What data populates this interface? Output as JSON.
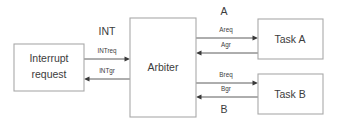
{
  "diagram": {
    "type": "block-diagram",
    "background_color": "#ffffff",
    "line_color": "#4a4a4a",
    "border_color": "#a9a9a9",
    "text_color": "#3c3c3c",
    "blocks": [
      {
        "id": "interrupt-request",
        "label_line1": "Interrupt",
        "label_line2": "request",
        "x": 14,
        "y": 44,
        "width": 70,
        "height": 47
      },
      {
        "id": "arbiter",
        "label": "Arbiter",
        "x": 130,
        "y": 18,
        "width": 66,
        "height": 99
      },
      {
        "id": "task-a",
        "label": "Task A",
        "x": 258,
        "y": 19,
        "width": 65,
        "height": 40
      },
      {
        "id": "task-b",
        "label": "Task B",
        "x": 258,
        "y": 74,
        "width": 65,
        "height": 40
      }
    ],
    "groups": [
      {
        "id": "int-group",
        "label": "INT",
        "x": 107,
        "y": 32
      },
      {
        "id": "a-group",
        "label": "A",
        "x": 224,
        "y": 12
      },
      {
        "id": "b-group",
        "label": "B",
        "x": 224,
        "y": 110
      }
    ],
    "signals": [
      {
        "id": "intreq",
        "label": "INTreq",
        "from": "interrupt-request",
        "to": "arbiter",
        "direction": "right",
        "label_x": 107,
        "label_y": 51,
        "y": 59,
        "x_start": 84,
        "x_end": 130
      },
      {
        "id": "intgr",
        "label": "INTgr",
        "from": "arbiter",
        "to": "interrupt-request",
        "direction": "left",
        "label_x": 107,
        "label_y": 71,
        "y": 79,
        "x_start": 130,
        "x_end": 84
      },
      {
        "id": "areq",
        "label": "Areq",
        "from": "arbiter",
        "to": "task-a",
        "direction": "right",
        "label_x": 226,
        "label_y": 30,
        "y": 38,
        "x_start": 196,
        "x_end": 258
      },
      {
        "id": "agr",
        "label": "Agr",
        "from": "task-a",
        "to": "arbiter",
        "direction": "left",
        "label_x": 226,
        "label_y": 45,
        "y": 53,
        "x_start": 258,
        "x_end": 196
      },
      {
        "id": "breq",
        "label": "Breq",
        "from": "arbiter",
        "to": "task-b",
        "direction": "right",
        "label_x": 226,
        "label_y": 75,
        "y": 83,
        "x_start": 196,
        "x_end": 258
      },
      {
        "id": "bgr",
        "label": "Bgr",
        "from": "task-b",
        "to": "arbiter",
        "direction": "left",
        "label_x": 226,
        "label_y": 89,
        "y": 97,
        "x_start": 258,
        "x_end": 196
      }
    ]
  }
}
